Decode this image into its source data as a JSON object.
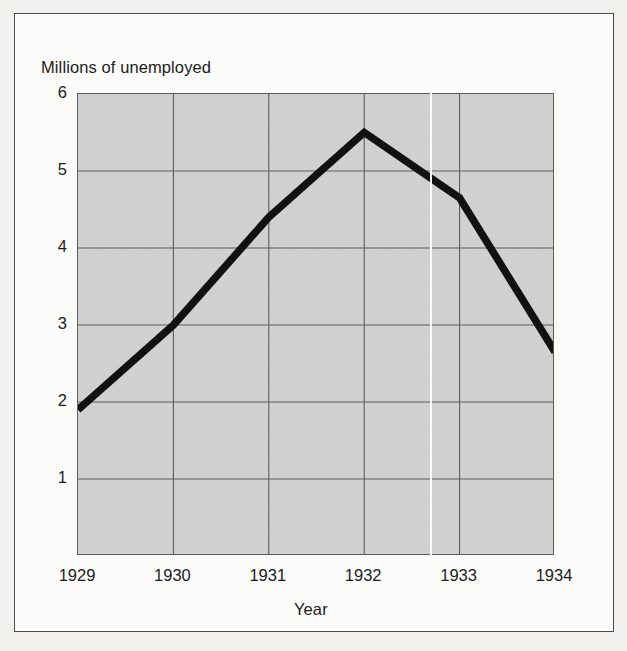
{
  "chart_data": {
    "type": "line",
    "title": "",
    "subtitle": "",
    "xlabel": "Year",
    "ylabel": "Millions of unemployed",
    "x": [
      1929,
      1930,
      1931,
      1932,
      1933,
      1934
    ],
    "categories": [
      "1929",
      "1930",
      "1931",
      "1932",
      "1933",
      "1934"
    ],
    "values": [
      1.9,
      3.0,
      4.4,
      5.5,
      4.65,
      2.65
    ],
    "series": [
      {
        "name": "Unemployed",
        "values": [
          1.9,
          3.0,
          4.4,
          5.5,
          4.65,
          2.65
        ]
      }
    ],
    "xlim": [
      1929,
      1934
    ],
    "ylim": [
      0,
      6
    ],
    "ytick_labels": [
      "6",
      "5",
      "4",
      "3",
      "2",
      "1"
    ],
    "ytick_values": [
      6,
      5,
      4,
      3,
      2,
      1
    ],
    "xtick_labels": [
      "1929",
      "1930",
      "1931",
      "1932",
      "1933",
      "1934"
    ],
    "grid": true,
    "legend": false,
    "legend_position": "none",
    "line_color": "#111111",
    "plot_background": "#d2d2d2",
    "grid_color": "#5c5c5c",
    "figure_background": "#fbfbfa",
    "page_background": "#f2f1ee"
  },
  "labels": {
    "y_axis_title": "Millions of unemployed",
    "x_axis_title": "Year"
  },
  "icons": {
    "scan_artifact": "white-scanline-artifact"
  }
}
